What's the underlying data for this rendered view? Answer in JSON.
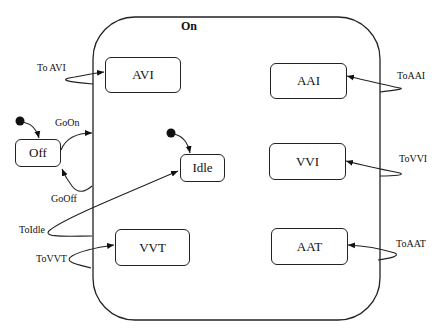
{
  "diagram": {
    "type": "state-machine",
    "composite_state": {
      "label": "On"
    },
    "states": [
      {
        "id": "avi",
        "label": "AVI"
      },
      {
        "id": "aai",
        "label": "AAI"
      },
      {
        "id": "vvi",
        "label": "VVI"
      },
      {
        "id": "idle",
        "label": "Idle"
      },
      {
        "id": "vvt",
        "label": "VVT"
      },
      {
        "id": "aat",
        "label": "AAT"
      },
      {
        "id": "off",
        "label": "Off"
      }
    ],
    "transitions": [
      {
        "label": "To AVI",
        "target": "AVI"
      },
      {
        "label": "ToAAI",
        "target": "AAI"
      },
      {
        "label": "ToVVI",
        "target": "VVI"
      },
      {
        "label": "ToIdle",
        "target": "Idle"
      },
      {
        "label": "ToVVT",
        "target": "VVT"
      },
      {
        "label": "ToAAT",
        "target": "AAT"
      },
      {
        "label": "GoOn",
        "source": "Off",
        "target": "On"
      },
      {
        "label": "GoOff",
        "source": "On",
        "target": "Off"
      }
    ],
    "initial_states": [
      "Off",
      "Idle"
    ]
  }
}
